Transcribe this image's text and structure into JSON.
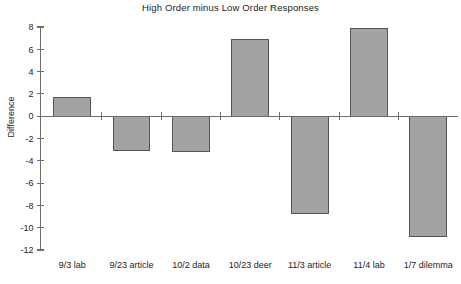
{
  "chart_data": {
    "type": "bar",
    "title": "High Order minus Low Order Responses",
    "xlabel": "",
    "ylabel": "Difference",
    "categories": [
      "9/3 lab",
      "9/23 article",
      "10/2 data",
      "10/23 deer",
      "11/3 article",
      "11/4 lab",
      "1/7 dilemma"
    ],
    "values": [
      1.65,
      -3.1,
      -3.15,
      6.9,
      -8.7,
      7.9,
      -10.8
    ],
    "ylim": [
      -12,
      8
    ],
    "yticks": [
      8,
      6,
      4,
      2,
      0,
      -2,
      -4,
      -6,
      -8,
      -10,
      -12
    ],
    "ytick_labels": [
      "8",
      "6",
      "4",
      "2",
      "0",
      "-2",
      "-4",
      "-6",
      "-8",
      "-10",
      "-12"
    ],
    "grid": false,
    "legend": null,
    "bar_fill_color": "#a3a3a3",
    "bar_edge_color": "#555555",
    "axis_color": "#6e6e6e",
    "background_color": "#ffffff"
  }
}
